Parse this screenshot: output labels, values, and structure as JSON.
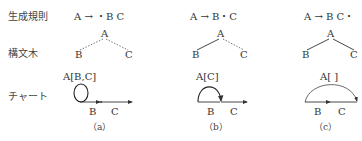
{
  "row_labels": {
    "rule": "生成規則",
    "tree": "構文木",
    "chart": "チャート"
  },
  "columns": [
    {
      "rule": "A → ・B C",
      "tree": {
        "root": "A",
        "left": "B",
        "right": "C",
        "left_edge": "dashed",
        "right_edge": "dashed"
      },
      "chart": {
        "edge_label": "A[B,C]",
        "node_labels": [
          "B",
          "C"
        ],
        "arc": "self-loop"
      },
      "caption": "（a）"
    },
    {
      "rule": "A → B・C",
      "tree": {
        "root": "A",
        "left": "B",
        "right": "C",
        "left_edge": "solid",
        "right_edge": "dashed"
      },
      "chart": {
        "edge_label": "A[C]",
        "node_labels": [
          "B",
          "C"
        ],
        "arc": "spans B"
      },
      "caption": "（b）"
    },
    {
      "rule": "A → B C・",
      "tree": {
        "root": "A",
        "left": "B",
        "right": "C",
        "left_edge": "solid",
        "right_edge": "solid"
      },
      "chart": {
        "edge_label": "A[ ]",
        "node_labels": [
          "B",
          "C"
        ],
        "arc": "spans B C"
      },
      "caption": "（c）"
    }
  ]
}
